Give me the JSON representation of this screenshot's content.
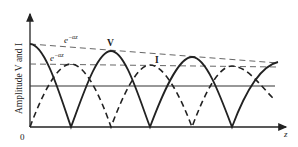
{
  "diagram": {
    "y_axis_label": "Amplitude V and I",
    "x_axis_label": "z",
    "origin_label": "0",
    "envelope_upper_label": "e",
    "envelope_upper_exp": "−αz",
    "envelope_lower_label": "e",
    "envelope_lower_exp": "−αz",
    "curve_v_label": "V",
    "curve_i_label": "I",
    "colors": {
      "line": "#222222",
      "dash": "#444444",
      "background": "#ffffff"
    }
  }
}
